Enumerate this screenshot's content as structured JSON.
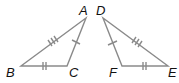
{
  "diagram": {
    "colors": {
      "line": "#8a8a8a",
      "label": "#111111",
      "background": "#ffffff"
    },
    "triangles": [
      {
        "name": "ABC",
        "vertices": {
          "A": {
            "label": "A",
            "x": 86,
            "y": 18
          },
          "B": {
            "label": "B",
            "x": 21,
            "y": 66
          },
          "C": {
            "label": "C",
            "x": 67,
            "y": 66
          }
        },
        "sides": [
          {
            "side": "AB",
            "ticks": 3
          },
          {
            "side": "BC",
            "ticks": 2
          },
          {
            "side": "CA",
            "ticks": 1
          }
        ]
      },
      {
        "name": "DEF",
        "vertices": {
          "D": {
            "label": "D",
            "x": 103,
            "y": 18
          },
          "F": {
            "label": "F",
            "x": 122,
            "y": 66
          },
          "E": {
            "label": "E",
            "x": 168,
            "y": 66
          }
        },
        "sides": [
          {
            "side": "DE",
            "ticks": 3
          },
          {
            "side": "FE",
            "ticks": 2
          },
          {
            "side": "DF",
            "ticks": 1
          }
        ]
      }
    ],
    "labels": {
      "A": "A",
      "B": "B",
      "C": "C",
      "D": "D",
      "E": "E",
      "F": "F"
    }
  }
}
